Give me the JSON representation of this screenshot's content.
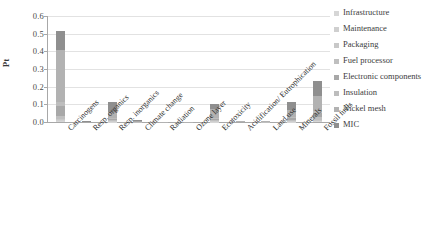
{
  "chart_data": {
    "type": "bar",
    "stacked": true,
    "title": "",
    "xlabel": "",
    "ylabel": "Pt",
    "ylim": [
      0.0,
      0.6
    ],
    "ytick_labels": [
      "0.0",
      "0.1",
      "0.2",
      "0.3",
      "0.4",
      "0.5",
      "0.6"
    ],
    "ytick_values": [
      0.0,
      0.1,
      0.2,
      0.3,
      0.4,
      0.5,
      0.6
    ],
    "grid": true,
    "legend_position": "right",
    "categories": [
      "Carcinogens",
      "Resp. organics",
      "Resp. inorganics",
      "Climate change",
      "Radiation",
      "Ozone layer",
      "Ecotoxicity",
      "Acidification/ Eutrophication",
      "Land use",
      "Minerals",
      "Fossil fuels"
    ],
    "series": [
      {
        "name": "Infrastructure",
        "color": "#d6d6d6",
        "values": [
          0.008,
          0.0,
          0.002,
          0.0,
          0.0,
          0.0,
          0.002,
          0.0,
          0.0,
          0.002,
          0.004
        ]
      },
      {
        "name": "Maintenance",
        "color": "#cfcfcf",
        "values": [
          0.006,
          0.0,
          0.002,
          0.0,
          0.0,
          0.0,
          0.002,
          0.0,
          0.0,
          0.002,
          0.004
        ]
      },
      {
        "name": "Packaging",
        "color": "#c8c8c8",
        "values": [
          0.006,
          0.0,
          0.002,
          0.0,
          0.0,
          0.0,
          0.002,
          0.0,
          0.0,
          0.002,
          0.004
        ]
      },
      {
        "name": "Fuel processor",
        "color": "#bfbfbf",
        "values": [
          0.012,
          0.0,
          0.004,
          0.002,
          0.0,
          0.0,
          0.004,
          0.0,
          0.001,
          0.006,
          0.016
        ]
      },
      {
        "name": "Electronic components",
        "color": "#a8a8a8",
        "values": [
          0.06,
          0.001,
          0.01,
          0.002,
          0.0,
          0.0,
          0.008,
          0.001,
          0.001,
          0.012,
          0.026
        ]
      },
      {
        "name": "Insulation",
        "color": "#bdbdbd",
        "values": [
          0.02,
          0.0,
          0.004,
          0.001,
          0.0,
          0.0,
          0.004,
          0.0,
          0.0,
          0.004,
          0.01
        ]
      },
      {
        "name": "Nickel mesh",
        "color": "#b2b2b2",
        "values": [
          0.298,
          0.001,
          0.035,
          0.003,
          0.001,
          0.001,
          0.05,
          0.002,
          0.002,
          0.042,
          0.086
        ]
      },
      {
        "name": "MIC",
        "color": "#8f8f8f",
        "values": [
          0.105,
          0.001,
          0.056,
          0.006,
          0.001,
          0.001,
          0.028,
          0.003,
          0.004,
          0.045,
          0.08
        ]
      }
    ],
    "totals": [
      0.515,
      0.003,
      0.115,
      0.014,
      0.002,
      0.002,
      0.1,
      0.006,
      0.008,
      0.115,
      0.23
    ],
    "bar_color_note": "grayscale stacked segments"
  },
  "legend": {
    "items": [
      {
        "label": "Infrastructure",
        "swatch": "#d6d6d6"
      },
      {
        "label": "Maintenance",
        "swatch": "#cfcfcf"
      },
      {
        "label": "Packaging",
        "swatch": "#c8c8c8"
      },
      {
        "label": "Fuel processor",
        "swatch": "#bfbfbf"
      },
      {
        "label": "Electronic components",
        "swatch": "#a8a8a8"
      },
      {
        "label": "Insulation",
        "swatch": "#bdbdbd"
      },
      {
        "label": "Nickel mesh",
        "swatch": "#b2b2b2"
      },
      {
        "label": "MIC",
        "swatch": "#8f8f8f"
      }
    ]
  },
  "axes": {
    "y_title": "Pt"
  }
}
